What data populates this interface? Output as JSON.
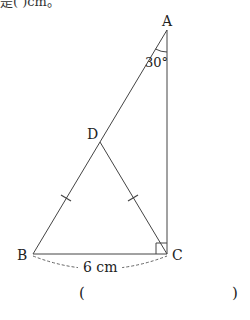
{
  "top_text": "是( )cm。",
  "diagram": {
    "points": {
      "A": {
        "label": "A",
        "x": 167,
        "y": 30
      },
      "B": {
        "label": "B",
        "x": 33,
        "y": 254
      },
      "C": {
        "label": "C",
        "x": 167,
        "y": 254
      },
      "D": {
        "label": "D",
        "x": 100,
        "y": 142
      }
    },
    "angle_label": "30°",
    "measure_label": "6 cm",
    "line_color": "#333333",
    "tick_color": "#333333"
  },
  "answer": {
    "open": "(",
    "close": ")"
  }
}
